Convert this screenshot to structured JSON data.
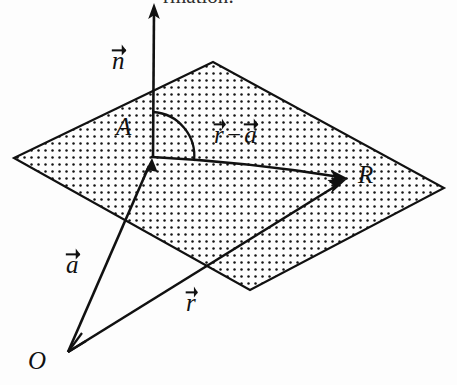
{
  "figure": {
    "caption_partial": "rmation:",
    "background_color": "#fdfdfd",
    "ink_color": "#111111",
    "labels": {
      "normal_vector": {
        "symbol": "n",
        "accent": "vector-arrow",
        "text": "n"
      },
      "point_a": {
        "text": "A"
      },
      "difference_vector": {
        "first": "r",
        "operator": "−",
        "second": "a",
        "text": "r − a"
      },
      "point_r": {
        "text": "R"
      },
      "position_vector_a": {
        "symbol": "a",
        "accent": "vector-arrow",
        "text": "a"
      },
      "position_vector_r": {
        "symbol": "r",
        "accent": "vector-arrow",
        "text": "r"
      },
      "origin": {
        "text": "O"
      }
    },
    "geometry": {
      "plane": {
        "shape": "parallelogram",
        "fill": "dot-stipple",
        "dot_spacing_px": 7,
        "corners": [
          {
            "name": "left",
            "x": 14,
            "y": 158
          },
          {
            "name": "top",
            "x": 213,
            "y": 62
          },
          {
            "name": "right",
            "x": 444,
            "y": 188
          },
          {
            "name": "bottom",
            "x": 250,
            "y": 290
          }
        ]
      },
      "points": [
        {
          "name": "A",
          "x": 152,
          "y": 156
        },
        {
          "name": "R",
          "x": 348,
          "y": 178
        },
        {
          "name": "O",
          "x": 68,
          "y": 352
        }
      ],
      "vectors": [
        {
          "name": "n",
          "from": {
            "x": 153,
            "y": 156
          },
          "to": {
            "x": 154,
            "y": 4
          },
          "arrowhead": "end"
        },
        {
          "name": "r-a",
          "from": {
            "x": 152,
            "y": 156
          },
          "to": {
            "x": 346,
            "y": 178
          },
          "arrowhead": "end",
          "curved": true
        },
        {
          "name": "a",
          "from": {
            "x": 68,
            "y": 352
          },
          "to": {
            "x": 152,
            "y": 158
          },
          "arrowhead": "end"
        },
        {
          "name": "r",
          "from": {
            "x": 68,
            "y": 352
          },
          "to": {
            "x": 347,
            "y": 179
          },
          "arrowhead": "end"
        }
      ],
      "angle_marker": {
        "name": "right-angle-arc",
        "vertex": {
          "x": 152,
          "y": 156
        },
        "radius_px": 44,
        "between": [
          "n",
          "r-a"
        ]
      }
    }
  }
}
